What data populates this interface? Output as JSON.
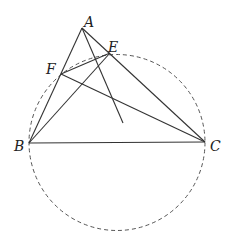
{
  "diagram": {
    "type": "geometry",
    "points": {
      "A": {
        "label": "A",
        "x": 82,
        "y": 28
      },
      "B": {
        "label": "B",
        "x": 29,
        "y": 143
      },
      "C": {
        "label": "C",
        "x": 205,
        "y": 142
      },
      "E": {
        "label": "E",
        "x": 110,
        "y": 53
      },
      "F": {
        "label": "F",
        "x": 61,
        "y": 74
      },
      "P": {
        "label": "",
        "x": 123,
        "y": 123
      }
    },
    "segments": [
      [
        "A",
        "B"
      ],
      [
        "A",
        "C"
      ],
      [
        "B",
        "C"
      ],
      [
        "B",
        "E"
      ],
      [
        "C",
        "F"
      ],
      [
        "F",
        "E"
      ],
      [
        "A",
        "P"
      ]
    ],
    "circle": {
      "cx": 117,
      "cy": 142.5,
      "r": 88,
      "style": "dashed",
      "through": [
        "B",
        "C",
        "E",
        "F"
      ]
    },
    "colors": {
      "line": "#333333",
      "circle": "#555555",
      "background": "#ffffff"
    },
    "labels": {
      "A": "A",
      "B": "B",
      "C": "C",
      "E": "E",
      "F": "F"
    }
  }
}
